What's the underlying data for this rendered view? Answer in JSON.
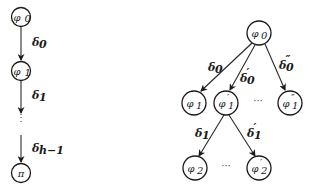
{
  "left_chain": {
    "nodes": [
      {
        "id": "phi0",
        "label": "φ",
        "sub": "0",
        "x": 21,
        "y": 17
      },
      {
        "id": "phi1",
        "label": "φ",
        "sub": "1",
        "x": 21,
        "y": 71
      },
      {
        "id": "pi",
        "label": "π",
        "sub": "",
        "x": 21,
        "y": 173
      }
    ],
    "edges": [
      {
        "label": "δ",
        "sub": "0"
      },
      {
        "label": "δ",
        "sub": "1"
      },
      {
        "label": "δ",
        "sub": "h−1"
      }
    ],
    "ellipsis": "⋮"
  },
  "right_tree": {
    "root": {
      "label": "φ",
      "sub": "0"
    },
    "level1": [
      {
        "label": "φ",
        "sub": "1",
        "prime": ""
      },
      {
        "label": "φ",
        "sub": "1",
        "prime": "′"
      },
      {
        "label": "φ",
        "sub": "1",
        "prime": "″"
      }
    ],
    "level1_edges": [
      {
        "label": "δ",
        "sub": "0",
        "prime": ""
      },
      {
        "label": "δ",
        "sub": "0",
        "prime": "′"
      },
      {
        "label": "δ",
        "sub": "0",
        "prime": "″"
      }
    ],
    "level2": [
      {
        "label": "φ",
        "sub": "2",
        "prime": ""
      },
      {
        "label": "φ",
        "sub": "2",
        "prime": "′"
      }
    ],
    "level2_edges": [
      {
        "label": "δ",
        "sub": "1",
        "prime": ""
      },
      {
        "label": "δ",
        "sub": "1",
        "prime": "′"
      }
    ],
    "ellipsis": "···"
  }
}
